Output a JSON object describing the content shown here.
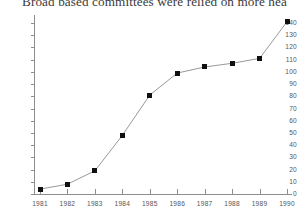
{
  "chart_data": {
    "type": "line",
    "title": "Broad based committees were relied on more hea",
    "title_note": "title is clipped at the top and right edge of the screenshot",
    "xlabel": "",
    "ylabel": "",
    "categories": [
      "1981",
      "1982",
      "1983",
      "1984",
      "1985",
      "1986",
      "1987",
      "1988",
      "1989",
      "1990"
    ],
    "values": [
      4,
      8,
      19,
      48,
      81,
      99,
      104,
      107,
      111,
      141
    ],
    "ylim": [
      0,
      140
    ],
    "yticks": [
      0,
      10,
      20,
      30,
      40,
      50,
      60,
      70,
      80,
      90,
      100,
      110,
      120,
      130,
      140
    ],
    "ytick_labels": [
      "0",
      "10",
      "20",
      "30",
      "40",
      "50",
      "60",
      "70",
      "80",
      "90",
      "100",
      "110",
      "120",
      "130",
      "140"
    ],
    "grid": false,
    "legend": false,
    "legend_position": "none",
    "marker": "filled-square",
    "colors": {
      "line": "#8d8d8d",
      "marker": "#101010",
      "axis": "#8d8d8d",
      "tick_text": "#555555",
      "title_text": "#3a3a3a",
      "background": "#ffffff"
    },
    "series": [
      {
        "name": "committees",
        "values": [
          4,
          8,
          19,
          48,
          81,
          99,
          104,
          107,
          111,
          141
        ]
      }
    ],
    "points": [
      {
        "x": "1981",
        "y": 4
      },
      {
        "x": "1982",
        "y": 8
      },
      {
        "x": "1983",
        "y": 19
      },
      {
        "x": "1984",
        "y": 48
      },
      {
        "x": "1985",
        "y": 81
      },
      {
        "x": "1986",
        "y": 99
      },
      {
        "x": "1987",
        "y": 104
      },
      {
        "x": "1988",
        "y": 107
      },
      {
        "x": "1989",
        "y": 111
      },
      {
        "x": "1990",
        "y": 141
      }
    ]
  }
}
